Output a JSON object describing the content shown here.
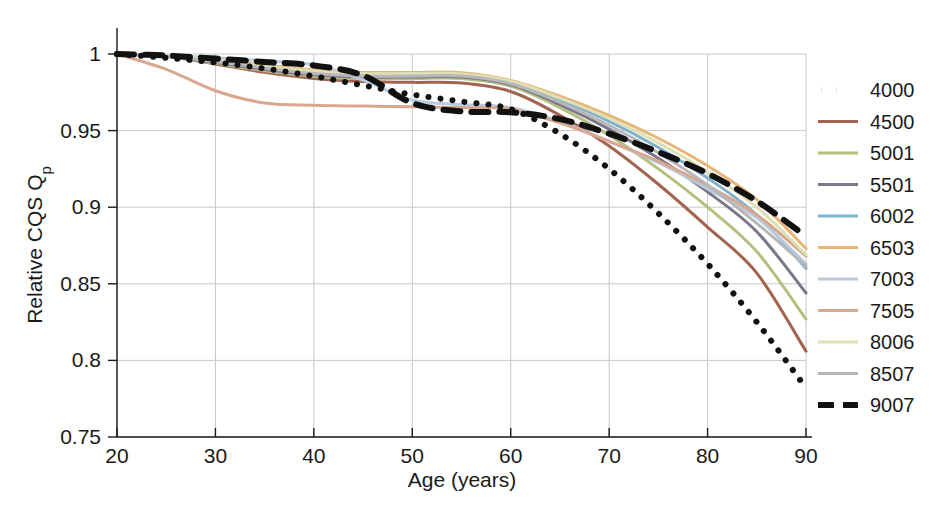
{
  "chart_data": {
    "type": "line",
    "title": "",
    "xlabel": "Age (years)",
    "ylabel": "Relative CQS Q",
    "ylabel_sub": "p",
    "xlim": [
      20,
      90
    ],
    "ylim": [
      0.75,
      1.0
    ],
    "xticks": [
      20,
      30,
      40,
      50,
      60,
      70,
      80,
      90
    ],
    "xticklabels": [
      "20",
      "30",
      "40",
      "50",
      "60",
      "70",
      "80",
      "90"
    ],
    "yticks": [
      0.75,
      0.8,
      0.85,
      0.9,
      0.95,
      1
    ],
    "yticklabels": [
      "0.75",
      "0.8",
      "0.85",
      "0.9",
      "0.95",
      "1"
    ],
    "grid": true,
    "legend_position": "right-outside",
    "x": [
      20,
      25,
      30,
      35,
      40,
      45,
      50,
      55,
      60,
      65,
      70,
      75,
      80,
      85,
      90
    ],
    "series": [
      {
        "name": "4000",
        "color": "#111111",
        "style": "dotted",
        "width": 6,
        "values": [
          1.0,
          0.9975,
          0.9945,
          0.9905,
          0.9855,
          0.9795,
          0.9735,
          0.969,
          0.964,
          0.948,
          0.925,
          0.896,
          0.863,
          0.825,
          0.782
        ]
      },
      {
        "name": "4500",
        "color": "#a2634f",
        "style": "solid",
        "width": 3,
        "values": [
          1.0,
          0.9985,
          0.9935,
          0.988,
          0.984,
          0.982,
          0.9815,
          0.981,
          0.9755,
          0.96,
          0.94,
          0.915,
          0.887,
          0.857,
          0.806
        ]
      },
      {
        "name": "5001",
        "color": "#b3c07e",
        "style": "solid",
        "width": 3,
        "values": [
          1.0,
          0.9985,
          0.994,
          0.989,
          0.9855,
          0.984,
          0.984,
          0.984,
          0.979,
          0.965,
          0.947,
          0.925,
          0.9,
          0.871,
          0.827
        ]
      },
      {
        "name": "5501",
        "color": "#7c7689",
        "style": "solid",
        "width": 3,
        "values": [
          1.0,
          0.9985,
          0.9945,
          0.99,
          0.9865,
          0.985,
          0.985,
          0.985,
          0.98,
          0.967,
          0.951,
          0.932,
          0.91,
          0.884,
          0.844
        ]
      },
      {
        "name": "6002",
        "color": "#7fb2cb",
        "style": "solid",
        "width": 3,
        "values": [
          1.0,
          0.9988,
          0.9955,
          0.9915,
          0.988,
          0.9865,
          0.9865,
          0.9865,
          0.9815,
          0.97,
          0.956,
          0.939,
          0.919,
          0.895,
          0.86
        ]
      },
      {
        "name": "6503",
        "color": "#e7b676",
        "style": "solid",
        "width": 3,
        "values": [
          1.0,
          0.999,
          0.9962,
          0.9928,
          0.9895,
          0.988,
          0.988,
          0.9878,
          0.9828,
          0.9725,
          0.96,
          0.945,
          0.927,
          0.905,
          0.873
        ]
      },
      {
        "name": "7003",
        "color": "#b9cbdf",
        "style": "solid",
        "width": 3,
        "values": [
          1.0,
          0.999,
          0.9975,
          0.9955,
          0.993,
          0.983,
          0.97,
          0.967,
          0.965,
          0.956,
          0.943,
          0.929,
          0.912,
          0.893,
          0.863
        ]
      },
      {
        "name": "7505",
        "color": "#d8a78e",
        "style": "solid",
        "width": 3,
        "values": [
          1.0,
          0.99,
          0.976,
          0.968,
          0.9665,
          0.966,
          0.9655,
          0.965,
          0.964,
          0.955,
          0.943,
          0.93,
          0.914,
          0.895,
          0.868
        ]
      },
      {
        "name": "8006",
        "color": "#dfdfb6",
        "style": "solid",
        "width": 3,
        "values": [
          1.0,
          0.9988,
          0.9958,
          0.992,
          0.9888,
          0.9872,
          0.9872,
          0.987,
          0.9822,
          0.9712,
          0.958,
          0.942,
          0.923,
          0.9,
          0.869
        ]
      },
      {
        "name": "8507",
        "color": "#b7b7bb",
        "style": "solid",
        "width": 3,
        "values": [
          1.0,
          0.9986,
          0.995,
          0.9908,
          0.9872,
          0.9856,
          0.9856,
          0.9856,
          0.9806,
          0.9685,
          0.9535,
          0.9355,
          0.9145,
          0.8895,
          0.8615
        ]
      },
      {
        "name": "9007",
        "color": "#111111",
        "style": "dashed",
        "width": 6,
        "values": [
          1.0,
          0.999,
          0.997,
          0.9948,
          0.9925,
          0.986,
          0.968,
          0.9625,
          0.962,
          0.9575,
          0.948,
          0.936,
          0.922,
          0.904,
          0.881
        ]
      }
    ]
  },
  "legend": {
    "entries": [
      {
        "label": "4000"
      },
      {
        "label": "4500"
      },
      {
        "label": "5001"
      },
      {
        "label": "5501"
      },
      {
        "label": "6002"
      },
      {
        "label": "6503"
      },
      {
        "label": "7003"
      },
      {
        "label": "7505"
      },
      {
        "label": "8006"
      },
      {
        "label": "8507"
      },
      {
        "label": "9007"
      }
    ]
  }
}
